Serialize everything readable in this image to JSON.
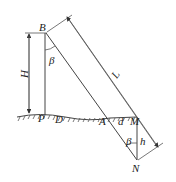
{
  "diagram": {
    "type": "geometry-measurement-sketch",
    "labels": {
      "B": "B",
      "beta_top": "β",
      "H": "H",
      "L": "L",
      "P": "P",
      "D": "D",
      "A": "A",
      "d": "d",
      "M": "M",
      "beta_bottom": "β",
      "h": "h",
      "N": "N"
    },
    "colors": {
      "line": "#444444",
      "text": "#222222",
      "background": "#ffffff"
    }
  }
}
